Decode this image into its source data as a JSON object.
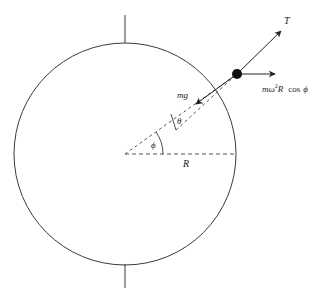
{
  "diagram": {
    "type": "free-body diagram on rotating sphere (Earth)",
    "labels": {
      "tension": "T",
      "centrifugal_m": "m",
      "centrifugal_omega": "ω",
      "centrifugal_sup": "2",
      "centrifugal_R": "R",
      "centrifugal_cos": "cos",
      "centrifugal_phi": "ϕ",
      "weight": "mg",
      "theta": "θ",
      "phi": "ϕ",
      "radius": "R"
    },
    "colors": {
      "line": "#3a3a3a",
      "dashed": "#555555",
      "mass": "#111111",
      "background": "#ffffff"
    },
    "elements": [
      "sphere-outline",
      "rotation-axis-top",
      "rotation-axis-bottom",
      "radius-dashed-horizontal",
      "radial-dashed-line-at-phi",
      "plumb-line-dashed-at-theta",
      "phi-angle-arc",
      "theta-angle-bracket",
      "mass-point",
      "tension-arrow",
      "centrifugal-arrow",
      "weight-arrow"
    ]
  }
}
